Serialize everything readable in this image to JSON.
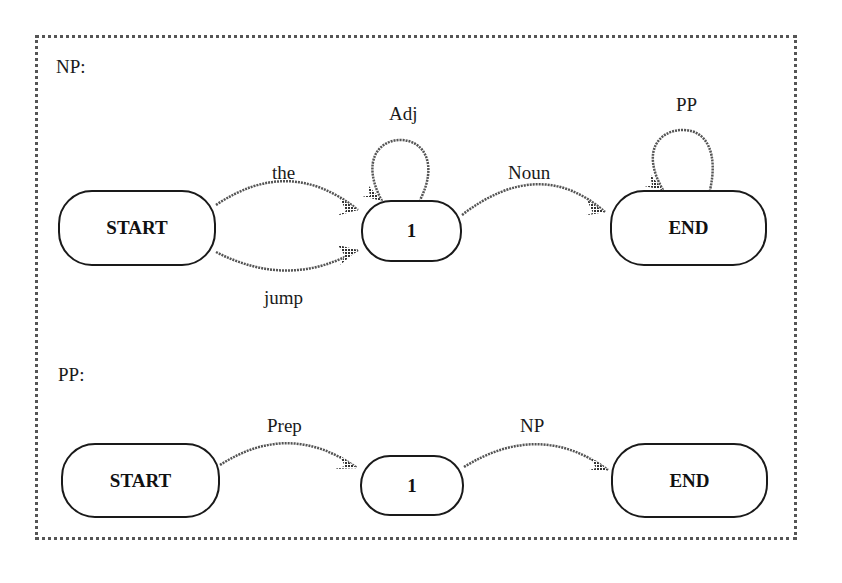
{
  "diagrams": [
    {
      "title": "NP:",
      "nodes": [
        {
          "id": "start",
          "label": "START"
        },
        {
          "id": "1",
          "label": "1"
        },
        {
          "id": "end",
          "label": "END"
        }
      ],
      "edges": [
        {
          "from": "START",
          "to": "1",
          "label": "the"
        },
        {
          "from": "START",
          "to": "1",
          "label": "jump"
        },
        {
          "from": "1",
          "to": "1",
          "label": "Adj"
        },
        {
          "from": "1",
          "to": "END",
          "label": "Noun"
        },
        {
          "from": "END",
          "to": "END",
          "label": "PP"
        }
      ]
    },
    {
      "title": "PP:",
      "nodes": [
        {
          "id": "start",
          "label": "START"
        },
        {
          "id": "1",
          "label": "1"
        },
        {
          "id": "end",
          "label": "END"
        }
      ],
      "edges": [
        {
          "from": "START",
          "to": "1",
          "label": "Prep"
        },
        {
          "from": "1",
          "to": "END",
          "label": "NP"
        }
      ]
    }
  ],
  "colors": {
    "stroke": "#1a1a1a",
    "edge": "#666666",
    "border": "#555555"
  }
}
